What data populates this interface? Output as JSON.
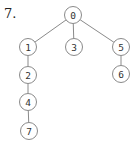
{
  "problem_label": "7.",
  "tree": {
    "nodes": [
      {
        "id": "0",
        "label": "0",
        "x": 73,
        "y": 15
      },
      {
        "id": "1",
        "label": "1",
        "x": 28,
        "y": 47
      },
      {
        "id": "3",
        "label": "3",
        "x": 74,
        "y": 47
      },
      {
        "id": "5",
        "label": "5",
        "x": 121,
        "y": 47
      },
      {
        "id": "2",
        "label": "2",
        "x": 28,
        "y": 75
      },
      {
        "id": "6",
        "label": "6",
        "x": 121,
        "y": 74
      },
      {
        "id": "4",
        "label": "4",
        "x": 28,
        "y": 102
      },
      {
        "id": "7",
        "label": "7",
        "x": 29,
        "y": 131
      }
    ],
    "edges": [
      [
        "0",
        "1"
      ],
      [
        "0",
        "3"
      ],
      [
        "0",
        "5"
      ],
      [
        "1",
        "2"
      ],
      [
        "2",
        "4"
      ],
      [
        "4",
        "7"
      ],
      [
        "5",
        "6"
      ]
    ],
    "node_radius": 8.5
  }
}
